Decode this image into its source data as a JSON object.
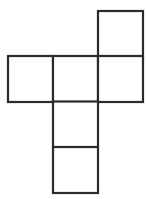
{
  "diagram": {
    "type": "cube-net",
    "stroke_color": "#2b2b2b",
    "fill_color": "#ffffff",
    "unit_px": 45,
    "origin": {
      "x": 8,
      "y": 11
    },
    "faces": [
      {
        "id": "face-top-right",
        "col": 2,
        "row": 0
      },
      {
        "id": "face-middle-left",
        "col": 0,
        "row": 1
      },
      {
        "id": "face-middle-center",
        "col": 1,
        "row": 1
      },
      {
        "id": "face-middle-right",
        "col": 2,
        "row": 1
      },
      {
        "id": "face-lower-center",
        "col": 1,
        "row": 2
      },
      {
        "id": "face-bottom-center",
        "col": 1,
        "row": 3
      }
    ]
  }
}
